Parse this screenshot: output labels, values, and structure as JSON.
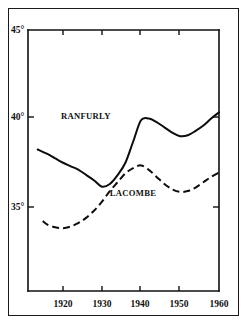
{
  "chart_data": {
    "type": "line",
    "title": "",
    "subtitle": "",
    "xlabel": "",
    "ylabel": "",
    "xlim": [
      1913,
      1960
    ],
    "ylim": [
      33,
      45
    ],
    "grid": false,
    "legend_position": "inline-annotation",
    "x_tick_labels": [
      "1920",
      "1930",
      "1940",
      "1950",
      "1960"
    ],
    "x_ticks": [
      1920,
      1930,
      1940,
      1950,
      1960
    ],
    "y_tick_labels": [
      "45°",
      "40°",
      "35°"
    ],
    "y_ticks": [
      45,
      40,
      35
    ],
    "series": [
      {
        "name": "RANFURLY",
        "style": "solid",
        "label_position": {
          "x": 1919.5,
          "y": 40.0
        },
        "x": [
          1913.5,
          1916,
          1918,
          1920,
          1922,
          1924,
          1926,
          1928,
          1930,
          1932,
          1934,
          1936,
          1938,
          1940,
          1942,
          1944,
          1946,
          1948,
          1950,
          1952,
          1954,
          1956,
          1958,
          1960
        ],
        "values": [
          38.25,
          38.0,
          37.75,
          37.5,
          37.3,
          37.1,
          36.8,
          36.5,
          36.15,
          36.3,
          36.8,
          37.5,
          38.7,
          39.9,
          40.0,
          39.8,
          39.5,
          39.2,
          39.0,
          39.05,
          39.3,
          39.6,
          40.0,
          40.35
        ]
      },
      {
        "name": "LACOMBE",
        "style": "dashed",
        "label_position": {
          "x": 1932.0,
          "y": 35.65
        },
        "x": [
          1914.8,
          1916,
          1918,
          1920,
          1922,
          1924,
          1926,
          1928,
          1930,
          1932,
          1934,
          1936,
          1938,
          1940,
          1942,
          1944,
          1946,
          1948,
          1950,
          1952,
          1954,
          1956,
          1958,
          1960
        ],
        "values": [
          34.2,
          34.0,
          33.85,
          33.8,
          33.9,
          34.1,
          34.4,
          34.8,
          35.3,
          35.9,
          36.4,
          36.9,
          37.2,
          37.35,
          37.1,
          36.7,
          36.3,
          36.0,
          35.85,
          35.9,
          36.1,
          36.4,
          36.7,
          36.95
        ]
      }
    ],
    "annotations": [
      {
        "text": "RANFURLY",
        "x": 1919.5,
        "y": 40.0
      },
      {
        "text": "LACOMBE",
        "x": 1932.0,
        "y": 35.65
      }
    ],
    "colors": {
      "line": "#0d0d0d",
      "axis": "#111111",
      "background": "#ffffff"
    }
  },
  "labels": {
    "y_45": "45°",
    "y_40": "40°",
    "y_35": "35°",
    "x_1920": "1920",
    "x_1930": "1930",
    "x_1940": "1940",
    "x_1950": "1950",
    "x_1960": "1960",
    "series_ranfurly": "RANFURLY",
    "series_lacombe": "LACOMBE"
  }
}
